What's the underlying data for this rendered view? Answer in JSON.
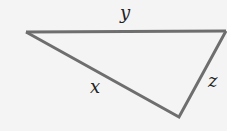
{
  "diagram": {
    "type": "triangle",
    "stroke_color": "#6e6e6e",
    "background": "#f4f4f4",
    "vertices": {
      "left": [
        26,
        32
      ],
      "right": [
        226,
        31
      ],
      "bottom": [
        179,
        117
      ]
    },
    "sides": [
      {
        "label": "y",
        "from": "left",
        "to": "right"
      },
      {
        "label": "x",
        "from": "left",
        "to": "bottom"
      },
      {
        "label": "z",
        "from": "bottom",
        "to": "right"
      }
    ]
  }
}
